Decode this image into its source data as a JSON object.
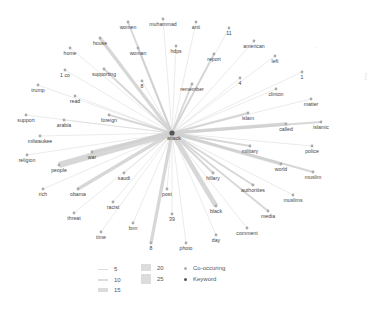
{
  "graph": {
    "keyword": {
      "label": "attack",
      "x": 172,
      "y": 133
    },
    "nodes": [
      {
        "label": "women",
        "x": 128,
        "y": 22,
        "w": 2
      },
      {
        "label": "muhammad",
        "x": 163,
        "y": 19,
        "w": 1
      },
      {
        "label": "anti",
        "x": 196,
        "y": 22,
        "w": 1
      },
      {
        "label": "11",
        "x": 229,
        "y": 28,
        "w": 1
      },
      {
        "label": "house",
        "x": 100,
        "y": 38,
        "w": 3
      },
      {
        "label": "woman",
        "x": 138,
        "y": 48,
        "w": 2
      },
      {
        "label": "hdps",
        "x": 176,
        "y": 46,
        "w": 1
      },
      {
        "label": "american",
        "x": 254,
        "y": 41,
        "w": 1
      },
      {
        "label": "home",
        "x": 70,
        "y": 48,
        "w": 1
      },
      {
        "label": "report",
        "x": 214,
        "y": 54,
        "w": 2
      },
      {
        "label": "left",
        "x": 275,
        "y": 56,
        "w": 1
      },
      {
        "label": "1 co",
        "x": 65,
        "y": 70,
        "w": 1
      },
      {
        "label": "supporting",
        "x": 104,
        "y": 69,
        "w": 2
      },
      {
        "label": "8",
        "x": 142,
        "y": 81,
        "w": 1
      },
      {
        "label": "remember",
        "x": 192,
        "y": 84,
        "w": 2
      },
      {
        "label": "4",
        "x": 240,
        "y": 78,
        "w": 1
      },
      {
        "label": "1",
        "x": 302,
        "y": 72,
        "w": 1
      },
      {
        "label": "trump",
        "x": 38,
        "y": 85,
        "w": 1
      },
      {
        "label": "read",
        "x": 75,
        "y": 96,
        "w": 1
      },
      {
        "label": "clinton",
        "x": 276,
        "y": 89,
        "w": 1
      },
      {
        "label": "matter",
        "x": 311,
        "y": 99,
        "w": 1
      },
      {
        "label": "support",
        "x": 26,
        "y": 115,
        "w": 1
      },
      {
        "label": "foreign",
        "x": 109,
        "y": 115,
        "w": 2
      },
      {
        "label": "arabia",
        "x": 64,
        "y": 120,
        "w": 1
      },
      {
        "label": "islam",
        "x": 248,
        "y": 113,
        "w": 2
      },
      {
        "label": "called",
        "x": 286,
        "y": 124,
        "w": 3
      },
      {
        "label": "islamic",
        "x": 321,
        "y": 122,
        "w": 2
      },
      {
        "label": "milwaukee",
        "x": 40,
        "y": 136,
        "w": 1
      },
      {
        "label": "religion",
        "x": 27,
        "y": 155,
        "w": 1
      },
      {
        "label": "war",
        "x": 92,
        "y": 152,
        "w": 3
      },
      {
        "label": "people",
        "x": 59,
        "y": 165,
        "w": 5
      },
      {
        "label": "military",
        "x": 250,
        "y": 146,
        "w": 2
      },
      {
        "label": "police",
        "x": 312,
        "y": 146,
        "w": 1
      },
      {
        "label": "saudi",
        "x": 124,
        "y": 173,
        "w": 1
      },
      {
        "label": "hillary",
        "x": 213,
        "y": 173,
        "w": 2
      },
      {
        "label": "world",
        "x": 281,
        "y": 164,
        "w": 3
      },
      {
        "label": "muslim",
        "x": 313,
        "y": 172,
        "w": 2
      },
      {
        "label": "rich",
        "x": 43,
        "y": 189,
        "w": 1
      },
      {
        "label": "obama",
        "x": 78,
        "y": 189,
        "w": 3
      },
      {
        "label": "authorities",
        "x": 253,
        "y": 185,
        "w": 2
      },
      {
        "label": "muslims",
        "x": 293,
        "y": 195,
        "w": 1
      },
      {
        "label": "racist",
        "x": 113,
        "y": 202,
        "w": 1
      },
      {
        "label": "post",
        "x": 167,
        "y": 189,
        "w": 1
      },
      {
        "label": "threat",
        "x": 74,
        "y": 213,
        "w": 1
      },
      {
        "label": "media",
        "x": 268,
        "y": 211,
        "w": 2
      },
      {
        "label": "black",
        "x": 216,
        "y": 206,
        "w": 4
      },
      {
        "label": "39",
        "x": 172,
        "y": 214,
        "w": 1
      },
      {
        "label": "bnn",
        "x": 133,
        "y": 223,
        "w": 1
      },
      {
        "label": "comment",
        "x": 247,
        "y": 228,
        "w": 1
      },
      {
        "label": "time",
        "x": 101,
        "y": 232,
        "w": 1
      },
      {
        "label": "day",
        "x": 216,
        "y": 235,
        "w": 1
      },
      {
        "label": "8",
        "x": 151,
        "y": 243,
        "w": 3
      },
      {
        "label": "photo",
        "x": 186,
        "y": 243,
        "w": 1
      }
    ]
  },
  "legend": {
    "edge_weights": [
      {
        "label": "5",
        "h": 1
      },
      {
        "label": "10",
        "h": 2
      },
      {
        "label": "15",
        "h": 4
      },
      {
        "label": "20",
        "h": 7
      },
      {
        "label": "25",
        "h": 10
      }
    ],
    "node_types": [
      {
        "label": "Co-occuring",
        "color": "#b0b0b0"
      },
      {
        "label": "Keyword",
        "color": "#555555"
      }
    ]
  },
  "colors": {
    "edge": "#d0d0d0",
    "node": "#aaaaaa",
    "keyword_node": "#555555",
    "label": "#444444"
  }
}
